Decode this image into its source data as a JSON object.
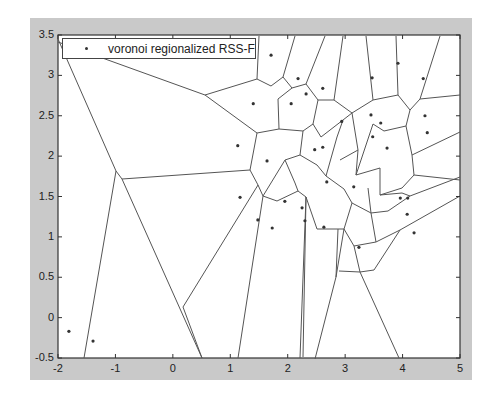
{
  "chart_data": {
    "type": "scatter",
    "subtype": "voronoi",
    "title": "",
    "xlabel": "",
    "ylabel": "",
    "xlim": [
      -2,
      5
    ],
    "ylim": [
      -0.5,
      3.5
    ],
    "xticks": [
      "-2",
      "-1",
      "0",
      "1",
      "2",
      "3",
      "4",
      "5"
    ],
    "yticks": [
      "-0.5",
      "0",
      "0.5",
      "1",
      "1.5",
      "2",
      "2.5",
      "3",
      "3.5"
    ],
    "grid": false,
    "legend": {
      "position": "top-left",
      "entries": [
        "voronoi regionalized RSS-F"
      ]
    },
    "series": [
      {
        "name": "voronoi regionalized RSS-F",
        "marker": "dot",
        "points": [
          [
            1.71,
            3.25
          ],
          [
            2.18,
            2.96
          ],
          [
            2.61,
            2.84
          ],
          [
            2.32,
            2.77
          ],
          [
            1.4,
            2.65
          ],
          [
            2.06,
            2.65
          ],
          [
            3.47,
            2.97
          ],
          [
            3.92,
            3.15
          ],
          [
            4.36,
            2.96
          ],
          [
            2.94,
            2.43
          ],
          [
            3.45,
            2.51
          ],
          [
            3.62,
            2.41
          ],
          [
            4.39,
            2.5
          ],
          [
            4.43,
            2.29
          ],
          [
            3.48,
            2.24
          ],
          [
            1.13,
            2.13
          ],
          [
            2.61,
            2.11
          ],
          [
            2.47,
            2.08
          ],
          [
            3.73,
            2.1
          ],
          [
            1.64,
            1.94
          ],
          [
            2.68,
            1.68
          ],
          [
            3.15,
            1.62
          ],
          [
            1.17,
            1.49
          ],
          [
            1.95,
            1.44
          ],
          [
            2.25,
            1.36
          ],
          [
            1.48,
            1.21
          ],
          [
            1.73,
            1.11
          ],
          [
            2.3,
            1.2
          ],
          [
            2.63,
            1.12
          ],
          [
            3.24,
            0.87
          ],
          [
            3.96,
            1.48
          ],
          [
            4.09,
            1.48
          ],
          [
            4.08,
            1.28
          ],
          [
            4.2,
            1.05
          ],
          [
            -1.81,
            -0.17
          ],
          [
            -1.39,
            -0.29
          ]
        ]
      }
    ],
    "voronoi_edges_px": [
      [
        [
          58,
          39
        ],
        [
          116,
          171
        ],
        [
          84,
          358
        ]
      ],
      [
        [
          58,
          42
        ],
        [
          205,
          95
        ],
        [
          257,
          79
        ]
      ],
      [
        [
          205,
          95
        ],
        [
          257,
          133
        ]
      ],
      [
        [
          257,
          79
        ],
        [
          259,
          36
        ]
      ],
      [
        [
          257,
          79
        ],
        [
          271,
          86
        ],
        [
          283,
          77
        ],
        [
          295,
          36
        ]
      ],
      [
        [
          257,
          133
        ],
        [
          250,
          170
        ],
        [
          122,
          179
        ],
        [
          116,
          171
        ]
      ],
      [
        [
          122,
          179
        ],
        [
          202,
          358
        ]
      ],
      [
        [
          250,
          170
        ],
        [
          258,
          185
        ],
        [
          183,
          307
        ],
        [
          202,
          358
        ]
      ],
      [
        [
          258,
          185
        ],
        [
          263,
          196
        ],
        [
          238,
          358
        ]
      ],
      [
        [
          283,
          77
        ],
        [
          292,
          88
        ],
        [
          306,
          84
        ],
        [
          325,
          36
        ]
      ],
      [
        [
          292,
          88
        ],
        [
          278,
          99
        ],
        [
          279,
          129
        ]
      ],
      [
        [
          257,
          133
        ],
        [
          279,
          129
        ],
        [
          303,
          131
        ]
      ],
      [
        [
          306,
          84
        ],
        [
          318,
          100
        ],
        [
          313,
          124
        ]
      ],
      [
        [
          318,
          100
        ],
        [
          334,
          100
        ],
        [
          343,
          36
        ]
      ],
      [
        [
          313,
          124
        ],
        [
          303,
          131
        ],
        [
          300,
          155
        ]
      ],
      [
        [
          313,
          124
        ],
        [
          321,
          137
        ],
        [
          343,
          120
        ]
      ],
      [
        [
          300,
          155
        ],
        [
          285,
          160
        ],
        [
          263,
          196
        ]
      ],
      [
        [
          300,
          155
        ],
        [
          317,
          165
        ],
        [
          326,
          176
        ]
      ],
      [
        [
          285,
          160
        ],
        [
          295,
          183
        ],
        [
          298,
          191
        ]
      ],
      [
        [
          298,
          191
        ],
        [
          306,
          197
        ],
        [
          303,
          357
        ]
      ],
      [
        [
          298,
          191
        ],
        [
          277,
          201
        ],
        [
          263,
          196
        ]
      ],
      [
        [
          343,
          120
        ],
        [
          337,
          137
        ],
        [
          326,
          176
        ]
      ],
      [
        [
          334,
          100
        ],
        [
          352,
          113
        ],
        [
          343,
          120
        ]
      ],
      [
        [
          352,
          113
        ],
        [
          373,
          100
        ],
        [
          366,
          36
        ]
      ],
      [
        [
          352,
          113
        ],
        [
          358,
          150
        ],
        [
          340,
          160
        ]
      ],
      [
        [
          358,
          150
        ],
        [
          356,
          175
        ]
      ],
      [
        [
          373,
          100
        ],
        [
          398,
          95
        ],
        [
          396,
          36
        ]
      ],
      [
        [
          398,
          95
        ],
        [
          410,
          110
        ],
        [
          420,
          99
        ],
        [
          440,
          36
        ]
      ],
      [
        [
          420,
          99
        ],
        [
          460,
          95
        ]
      ],
      [
        [
          410,
          110
        ],
        [
          406,
          126
        ],
        [
          384,
          131
        ],
        [
          373,
          124
        ],
        [
          356,
          175
        ]
      ],
      [
        [
          406,
          126
        ],
        [
          412,
          155
        ],
        [
          460,
          132
        ]
      ],
      [
        [
          412,
          155
        ],
        [
          414,
          175
        ],
        [
          402,
          188
        ],
        [
          380,
          195
        ],
        [
          380,
          168
        ],
        [
          356,
          175
        ]
      ],
      [
        [
          380,
          195
        ],
        [
          402,
          193
        ],
        [
          410,
          196
        ],
        [
          460,
          177
        ]
      ],
      [
        [
          414,
          175
        ],
        [
          460,
          180
        ]
      ],
      [
        [
          410,
          196
        ],
        [
          388,
          211
        ],
        [
          371,
          213
        ],
        [
          368,
          188
        ]
      ],
      [
        [
          326,
          176
        ],
        [
          344,
          189
        ],
        [
          352,
          203
        ],
        [
          371,
          213
        ]
      ],
      [
        [
          352,
          203
        ],
        [
          344,
          229
        ],
        [
          336,
          277
        ],
        [
          315,
          359
        ]
      ],
      [
        [
          336,
          277
        ],
        [
          338,
          229
        ]
      ],
      [
        [
          344,
          229
        ],
        [
          317,
          229
        ],
        [
          306,
          197
        ]
      ],
      [
        [
          371,
          213
        ],
        [
          376,
          242
        ],
        [
          354,
          246
        ],
        [
          344,
          229
        ]
      ],
      [
        [
          376,
          242
        ],
        [
          400,
          230
        ],
        [
          460,
          196
        ]
      ],
      [
        [
          354,
          246
        ],
        [
          360,
          272
        ],
        [
          339,
          271
        ]
      ],
      [
        [
          360,
          272
        ],
        [
          374,
          270
        ],
        [
          400,
          230
        ]
      ],
      [
        [
          360,
          272
        ],
        [
          399,
          358
        ]
      ],
      [
        [
          306,
          197
        ],
        [
          300,
          358
        ]
      ]
    ]
  },
  "legend": {
    "label": "voronoi regionalized RSS-F"
  },
  "colors": {
    "figure_bg": "#c9c9c9",
    "axes_bg": "#ffffff",
    "line": "#555555",
    "point": "#333333"
  }
}
